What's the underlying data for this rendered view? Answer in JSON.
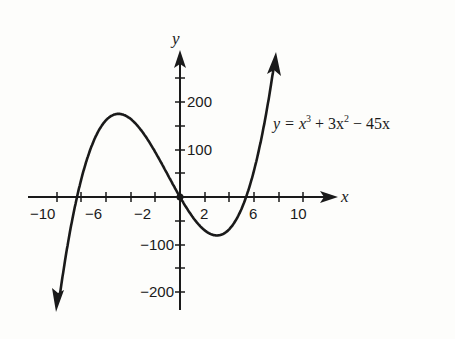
{
  "chart_data": {
    "type": "line",
    "title": "",
    "function": "y = x^3 + 3x^2 - 45x",
    "xlabel": "x",
    "ylabel": "y",
    "xlim": [
      -10,
      10
    ],
    "ylim": [
      -200,
      200
    ],
    "x_ticks": [
      -10,
      -8,
      -6,
      -4,
      -2,
      0,
      2,
      4,
      6,
      8,
      10
    ],
    "x_tick_labels": [
      "-10",
      "-6",
      "-2",
      "2",
      "6",
      "10"
    ],
    "y_ticks": [
      -200,
      -150,
      -100,
      -50,
      0,
      50,
      100,
      150,
      200,
      250
    ],
    "y_tick_labels": [
      "200",
      "100",
      "-100",
      "-200"
    ],
    "grid": false,
    "series": [
      {
        "name": "y = x³ + 3x² − 45x",
        "x": [
          -9.9,
          -9,
          -8,
          -7.4,
          -7,
          -6,
          -5,
          -4,
          -3,
          -2,
          -1,
          0,
          1,
          2,
          3,
          4,
          5,
          6,
          7,
          7.8
        ],
        "values": [
          -237,
          -81,
          40,
          103,
          126,
          162,
          175,
          172,
          162,
          94,
          47,
          0,
          -41,
          -70,
          -81,
          -68,
          -25,
          54,
          168,
          298
        ]
      }
    ],
    "key_points": {
      "local_max": [
        -5,
        175
      ],
      "local_min": [
        3,
        -81
      ],
      "roots": [
        -8.4,
        0,
        5.4
      ]
    }
  },
  "labels": {
    "x_axis": "x",
    "y_axis": "y",
    "equation_prefix": "y = x",
    "equation_exp1": "3",
    "equation_mid": " + 3x",
    "equation_exp2": "2",
    "equation_suffix": " − 45x",
    "xt": [
      "−10",
      "−6",
      "−2",
      "2",
      "6",
      "10"
    ],
    "yt": [
      "200",
      "100",
      "−100",
      "−200"
    ]
  }
}
